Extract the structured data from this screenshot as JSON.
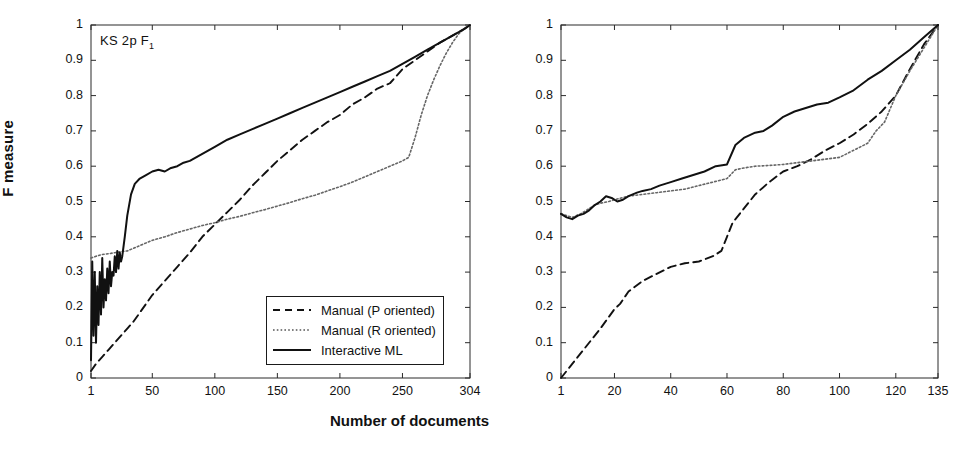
{
  "figure": {
    "xlabel": "Number of documents",
    "ylabel": "F measure"
  },
  "panels": [
    {
      "id": "left",
      "title_main": "KS 2p F",
      "title_sub": "1"
    },
    {
      "id": "right",
      "title_main": "AK 2p F",
      "title_sub": "1"
    }
  ],
  "legend": {
    "entries": [
      {
        "label": "Manual (P oriented)",
        "style": "dashed"
      },
      {
        "label": "Manual (R oriented)",
        "style": "dotted"
      },
      {
        "label": "Interactive ML",
        "style": "solid"
      }
    ]
  },
  "yticks": [
    "0",
    "0.1",
    "0.2",
    "0.3",
    "0.4",
    "0.5",
    "0.6",
    "0.7",
    "0.8",
    "0.9",
    "1"
  ],
  "chart_data": [
    {
      "type": "line",
      "title": "KS 2p F1",
      "xlabel": "Number of documents",
      "ylabel": "F measure",
      "xlim": [
        1,
        304
      ],
      "ylim": [
        0,
        1
      ],
      "xticks": [
        1,
        50,
        100,
        150,
        200,
        250,
        304
      ],
      "xtick_labels": [
        "1",
        "50",
        "100",
        "150",
        "200",
        "250",
        "304"
      ],
      "yticks": [
        0,
        0.1,
        0.2,
        0.3,
        0.4,
        0.5,
        0.6,
        0.7,
        0.8,
        0.9,
        1
      ],
      "grid": false,
      "legend_position": "lower-right",
      "series": [
        {
          "name": "Manual (P oriented)",
          "style": "dashed",
          "x": [
            1,
            5,
            10,
            15,
            20,
            25,
            30,
            35,
            40,
            45,
            50,
            60,
            70,
            80,
            90,
            100,
            110,
            120,
            130,
            140,
            150,
            160,
            170,
            180,
            190,
            200,
            210,
            220,
            230,
            240,
            245,
            250,
            260,
            270,
            280,
            290,
            300,
            304
          ],
          "y": [
            0.02,
            0.04,
            0.06,
            0.08,
            0.1,
            0.12,
            0.14,
            0.16,
            0.185,
            0.21,
            0.235,
            0.275,
            0.315,
            0.355,
            0.4,
            0.435,
            0.47,
            0.505,
            0.545,
            0.58,
            0.615,
            0.645,
            0.675,
            0.7,
            0.725,
            0.745,
            0.775,
            0.795,
            0.82,
            0.835,
            0.855,
            0.875,
            0.9,
            0.925,
            0.95,
            0.97,
            0.99,
            1.0
          ]
        },
        {
          "name": "Manual (R oriented)",
          "style": "dotted",
          "x": [
            1,
            5,
            10,
            15,
            20,
            25,
            30,
            40,
            50,
            60,
            70,
            80,
            90,
            100,
            110,
            120,
            130,
            140,
            150,
            160,
            170,
            180,
            190,
            200,
            210,
            220,
            230,
            240,
            250,
            255,
            260,
            265,
            270,
            275,
            280,
            285,
            290,
            295,
            300,
            304
          ],
          "y": [
            0.34,
            0.345,
            0.35,
            0.352,
            0.355,
            0.358,
            0.36,
            0.375,
            0.39,
            0.4,
            0.412,
            0.422,
            0.432,
            0.44,
            0.45,
            0.458,
            0.468,
            0.477,
            0.487,
            0.497,
            0.508,
            0.518,
            0.53,
            0.542,
            0.555,
            0.57,
            0.585,
            0.6,
            0.615,
            0.625,
            0.68,
            0.745,
            0.8,
            0.845,
            0.885,
            0.92,
            0.95,
            0.975,
            0.992,
            1.0
          ]
        },
        {
          "name": "Interactive ML",
          "style": "solid",
          "x": [
            1,
            2,
            3,
            4,
            5,
            6,
            7,
            8,
            9,
            10,
            11,
            12,
            13,
            14,
            15,
            16,
            17,
            18,
            19,
            20,
            21,
            22,
            23,
            24,
            25,
            26,
            28,
            30,
            33,
            36,
            40,
            45,
            50,
            55,
            60,
            65,
            70,
            75,
            80,
            90,
            100,
            110,
            120,
            130,
            140,
            150,
            160,
            170,
            180,
            190,
            200,
            210,
            220,
            230,
            240,
            250,
            260,
            270,
            280,
            290,
            300,
            304
          ],
          "y": [
            0.05,
            0.33,
            0.12,
            0.3,
            0.1,
            0.26,
            0.15,
            0.3,
            0.18,
            0.34,
            0.2,
            0.28,
            0.22,
            0.31,
            0.24,
            0.33,
            0.26,
            0.3,
            0.29,
            0.345,
            0.3,
            0.36,
            0.31,
            0.355,
            0.33,
            0.345,
            0.4,
            0.46,
            0.52,
            0.55,
            0.565,
            0.575,
            0.585,
            0.59,
            0.585,
            0.595,
            0.6,
            0.61,
            0.615,
            0.635,
            0.655,
            0.675,
            0.69,
            0.705,
            0.72,
            0.735,
            0.75,
            0.765,
            0.78,
            0.795,
            0.81,
            0.825,
            0.84,
            0.855,
            0.87,
            0.89,
            0.91,
            0.93,
            0.95,
            0.97,
            0.99,
            1.0
          ]
        }
      ]
    },
    {
      "type": "line",
      "title": "AK 2p F1",
      "xlabel": "Number of documents",
      "ylabel": "F measure",
      "xlim": [
        1,
        135
      ],
      "ylim": [
        0,
        1
      ],
      "xticks": [
        1,
        20,
        40,
        60,
        80,
        100,
        120,
        135
      ],
      "xtick_labels": [
        "1",
        "20",
        "40",
        "60",
        "80",
        "100",
        "120",
        "135"
      ],
      "yticks": [
        0,
        0.1,
        0.2,
        0.3,
        0.4,
        0.5,
        0.6,
        0.7,
        0.8,
        0.9,
        1
      ],
      "grid": false,
      "legend_position": "lower-right",
      "series": [
        {
          "name": "Manual (P oriented)",
          "style": "dashed",
          "x": [
            1,
            5,
            10,
            15,
            20,
            22,
            25,
            30,
            35,
            40,
            45,
            50,
            55,
            58,
            60,
            62,
            65,
            68,
            70,
            75,
            80,
            85,
            90,
            95,
            100,
            105,
            110,
            115,
            120,
            125,
            130,
            135
          ],
          "y": [
            0.0,
            0.04,
            0.09,
            0.14,
            0.195,
            0.21,
            0.245,
            0.275,
            0.295,
            0.315,
            0.325,
            0.33,
            0.345,
            0.36,
            0.4,
            0.44,
            0.47,
            0.5,
            0.52,
            0.555,
            0.585,
            0.6,
            0.62,
            0.645,
            0.665,
            0.69,
            0.72,
            0.755,
            0.8,
            0.875,
            0.945,
            1.0
          ]
        },
        {
          "name": "Manual (R oriented)",
          "style": "dotted",
          "x": [
            1,
            3,
            5,
            8,
            10,
            13,
            15,
            18,
            20,
            25,
            30,
            35,
            40,
            45,
            50,
            55,
            60,
            63,
            66,
            70,
            75,
            80,
            85,
            90,
            95,
            100,
            105,
            110,
            113,
            116,
            120,
            125,
            130,
            135
          ],
          "y": [
            0.465,
            0.46,
            0.455,
            0.465,
            0.475,
            0.49,
            0.495,
            0.5,
            0.505,
            0.515,
            0.52,
            0.525,
            0.53,
            0.535,
            0.545,
            0.555,
            0.565,
            0.59,
            0.595,
            0.6,
            0.602,
            0.605,
            0.61,
            0.615,
            0.62,
            0.625,
            0.645,
            0.665,
            0.7,
            0.725,
            0.8,
            0.87,
            0.935,
            1.0
          ]
        },
        {
          "name": "Interactive ML",
          "style": "solid",
          "x": [
            1,
            3,
            5,
            7,
            9,
            11,
            13,
            15,
            17,
            19,
            21,
            23,
            25,
            28,
            30,
            33,
            36,
            40,
            44,
            48,
            52,
            56,
            60,
            63,
            66,
            70,
            73,
            76,
            80,
            84,
            88,
            92,
            96,
            100,
            105,
            110,
            115,
            120,
            125,
            130,
            135
          ],
          "y": [
            0.465,
            0.455,
            0.45,
            0.46,
            0.465,
            0.475,
            0.49,
            0.5,
            0.515,
            0.51,
            0.5,
            0.505,
            0.515,
            0.525,
            0.53,
            0.535,
            0.545,
            0.555,
            0.565,
            0.575,
            0.585,
            0.6,
            0.605,
            0.66,
            0.68,
            0.695,
            0.7,
            0.715,
            0.74,
            0.755,
            0.765,
            0.775,
            0.78,
            0.795,
            0.815,
            0.845,
            0.87,
            0.9,
            0.93,
            0.965,
            1.0
          ]
        }
      ]
    }
  ]
}
